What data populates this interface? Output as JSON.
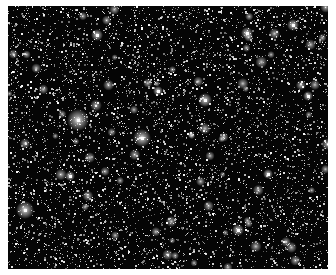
{
  "image": {
    "subject": "dense star field",
    "description": "Black-and-white astronomical image of a crowded star field with many faint point sources and a few bright stars",
    "background_color": "#050505",
    "star_color": "#ffffff",
    "border_color": "#ffffff"
  }
}
